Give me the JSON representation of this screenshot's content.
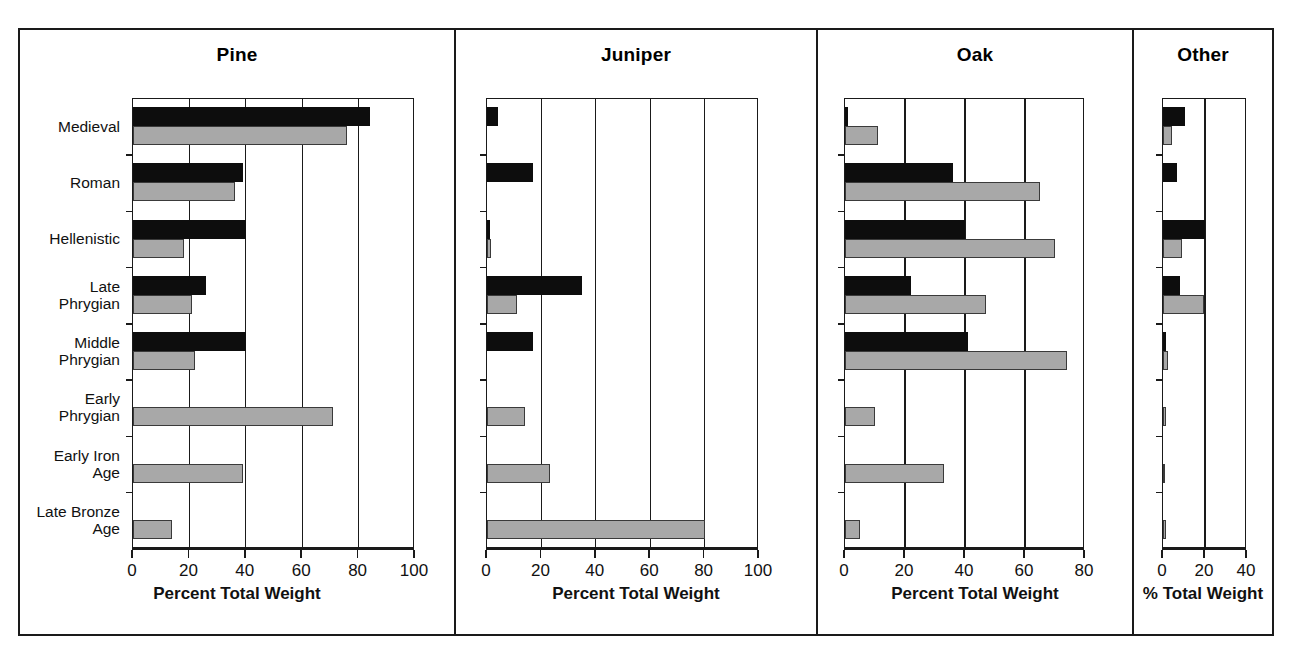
{
  "figure": {
    "background": "#ffffff",
    "frame_color": "#1a1a1a",
    "series_colors": {
      "dark": "#0d0d0d",
      "light": "#a8a8a8"
    }
  },
  "categories": [
    "Medieval",
    "Roman",
    "Hellenistic",
    "Late\nPhrygian",
    "Middle\nPhrygian",
    "Early\nPhrygian",
    "Early Iron\nAge",
    "Late Bronze\nAge"
  ],
  "panels": [
    {
      "title": "Pine",
      "xlabel": "Percent Total Weight",
      "xlim": [
        0,
        100
      ],
      "xticks": [
        0,
        20,
        40,
        60,
        80,
        100
      ],
      "ticklabels": [
        "0",
        "20",
        "40",
        "60",
        "80",
        "100"
      ]
    },
    {
      "title": "Juniper",
      "xlabel": "Percent Total Weight",
      "xlim": [
        0,
        100
      ],
      "xticks": [
        0,
        20,
        40,
        60,
        80,
        100
      ],
      "ticklabels": [
        "0",
        "20",
        "40",
        "60",
        "80",
        "100"
      ]
    },
    {
      "title": "Oak",
      "xlabel": "Percent Total Weight",
      "xlim": [
        0,
        80
      ],
      "xticks": [
        0,
        20,
        40,
        60,
        80
      ],
      "ticklabels": [
        "0",
        "20",
        "40",
        "60",
        "80"
      ]
    },
    {
      "title": "Other",
      "xlabel": "% Total Weight",
      "xlim": [
        0,
        40
      ],
      "xticks": [
        0,
        20,
        40
      ],
      "ticklabels": [
        "0",
        "20",
        "40"
      ]
    }
  ],
  "chart_data": [
    {
      "type": "bar",
      "title": "Pine",
      "orientation": "horizontal",
      "xlabel": "Percent Total Weight",
      "ylabel": "",
      "xlim": [
        0,
        100
      ],
      "grid": true,
      "legend": "none",
      "categories": [
        "Medieval",
        "Roman",
        "Hellenistic",
        "Late Phrygian",
        "Middle Phrygian",
        "Early Phrygian",
        "Early Iron Age",
        "Late Bronze Age"
      ],
      "series": [
        {
          "name": "dark",
          "values": [
            84,
            39,
            40,
            26,
            40,
            0,
            0,
            0
          ]
        },
        {
          "name": "light",
          "values": [
            76,
            36,
            18,
            21,
            22,
            71,
            39,
            14
          ]
        }
      ]
    },
    {
      "type": "bar",
      "title": "Juniper",
      "orientation": "horizontal",
      "xlabel": "Percent Total Weight",
      "ylabel": "",
      "xlim": [
        0,
        100
      ],
      "grid": true,
      "legend": "none",
      "categories": [
        "Medieval",
        "Roman",
        "Hellenistic",
        "Late Phrygian",
        "Middle Phrygian",
        "Early Phrygian",
        "Early Iron Age",
        "Late Bronze Age"
      ],
      "series": [
        {
          "name": "dark",
          "values": [
            4,
            17,
            1,
            35,
            17,
            0,
            0,
            0
          ]
        },
        {
          "name": "light",
          "values": [
            0,
            0,
            1.5,
            11,
            0,
            14,
            23,
            80
          ]
        }
      ]
    },
    {
      "type": "bar",
      "title": "Oak",
      "orientation": "horizontal",
      "xlabel": "Percent Total Weight",
      "ylabel": "",
      "xlim": [
        0,
        80
      ],
      "grid": true,
      "legend": "none",
      "categories": [
        "Medieval",
        "Roman",
        "Hellenistic",
        "Late Phrygian",
        "Middle Phrygian",
        "Early Phrygian",
        "Early Iron Age",
        "Late Bronze Age"
      ],
      "series": [
        {
          "name": "dark",
          "values": [
            1,
            36,
            40,
            22,
            41,
            0,
            0,
            0
          ]
        },
        {
          "name": "light",
          "values": [
            11,
            65,
            70,
            47,
            74,
            10,
            33,
            5
          ]
        }
      ]
    },
    {
      "type": "bar",
      "title": "Other",
      "orientation": "horizontal",
      "xlabel": "% Total Weight",
      "ylabel": "",
      "xlim": [
        0,
        40
      ],
      "grid": true,
      "legend": "none",
      "categories": [
        "Medieval",
        "Roman",
        "Hellenistic",
        "Late Phrygian",
        "Middle Phrygian",
        "Early Phrygian",
        "Early Iron Age",
        "Late Bronze Age"
      ],
      "series": [
        {
          "name": "dark",
          "values": [
            10.5,
            6.5,
            20,
            8,
            1.5,
            0,
            0,
            0
          ]
        },
        {
          "name": "light",
          "values": [
            4.5,
            0,
            9,
            19.5,
            2.5,
            1.5,
            0.7,
            1.5
          ]
        }
      ]
    }
  ]
}
